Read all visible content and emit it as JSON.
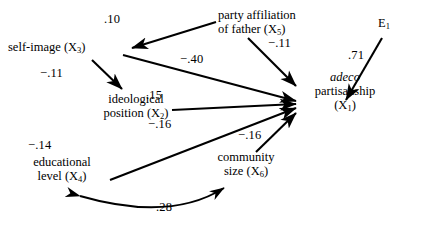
{
  "diagram": {
    "type": "path-diagram",
    "title": "",
    "nodes": [
      {
        "id": "x3",
        "label_line1": "self-image (X",
        "sub": "3",
        "label_line2": ")",
        "full": "self-image (X3)"
      },
      {
        "id": "x5",
        "label_line1": "party affiliation",
        "label_line2": "of father (X",
        "sub": "5",
        "label_line3": ")",
        "full": "party affiliation of father (X5)"
      },
      {
        "id": "x2",
        "label_line1": "ideological",
        "label_line2": "position (X",
        "sub": "2",
        "label_line3": ")",
        "full": "ideological position (X2)"
      },
      {
        "id": "x4",
        "label_line1": "educational",
        "label_line2": "level (X",
        "sub": "4",
        "label_line3": ")",
        "full": "educational level (X4)"
      },
      {
        "id": "x6",
        "label_line1": "community",
        "label_line2": "size (X",
        "sub": "6",
        "label_line3": ")",
        "full": "community size (X6)"
      },
      {
        "id": "x1",
        "label_line1": "adeco",
        "label_line2": "partisanship",
        "label_line3": "(X",
        "sub": "1",
        "label_line4": ")",
        "full": "adeco partisanship (X1)"
      },
      {
        "id": "e1",
        "label_line1": "E",
        "sub": "1",
        "full": "E1"
      }
    ],
    "coefficients": {
      "x5_to_x3": ".10",
      "x3_to_x2": "−.11",
      "x3_to_x1": "−.40",
      "x5_to_x1": "−.11",
      "x2_to_x1": ".15",
      "x4_to_x1": "−.16",
      "x6_to_x1": "−.16",
      "x4_label": "−.14",
      "x4_corr_x6": ".28",
      "e1_to_x1": ".71"
    },
    "colors": {
      "stroke": "#000000",
      "background": "#ffffff",
      "text": "#000000"
    }
  }
}
